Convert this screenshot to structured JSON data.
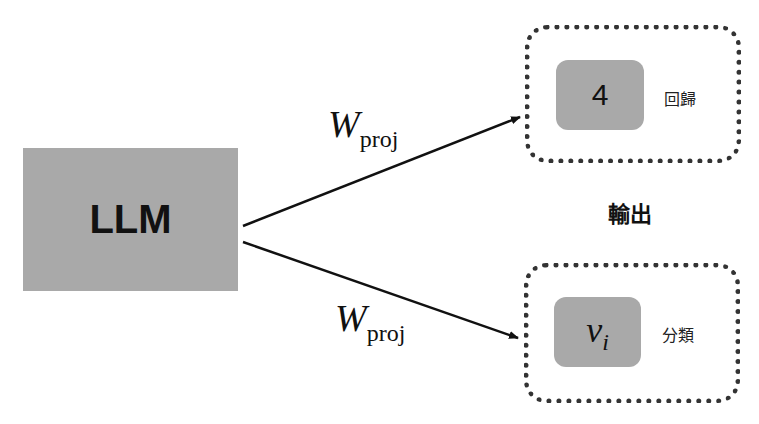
{
  "diagram": {
    "source": {
      "label": "LLM",
      "fill": "#a9a9a9"
    },
    "edges": [
      {
        "label_main": "W",
        "label_sub": "proj",
        "to": "regression"
      },
      {
        "label_main": "W",
        "label_sub": "proj",
        "to": "classification"
      }
    ],
    "output_group_label": "輸出",
    "outputs": [
      {
        "id": "regression",
        "value": "4",
        "task_label": "回歸"
      },
      {
        "id": "classification",
        "value_main": "v",
        "value_sub": "i",
        "task_label": "分類"
      }
    ],
    "colors": {
      "box_fill": "#a9a9a9",
      "line": "#111111",
      "dotted_border": "#333333"
    }
  }
}
